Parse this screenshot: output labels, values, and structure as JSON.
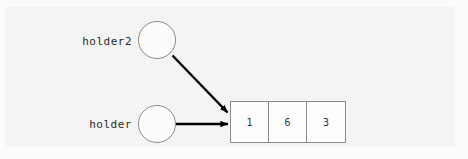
{
  "diagram": {
    "type": "pointer-to-array-diagram",
    "background_color": "#f4f4f4",
    "nodes": [
      {
        "id": "holder2",
        "label": "holder2",
        "shape": "circle",
        "fill": "#fcfcfc",
        "stroke": "#8a8a8a"
      },
      {
        "id": "holder",
        "label": "holder",
        "shape": "circle",
        "fill": "#fcfcfc",
        "stroke": "#8a8a8a"
      }
    ],
    "array": {
      "name": "array-box",
      "stroke": "#8a8a8a",
      "fill": "#fdfdfd",
      "cells": [
        {
          "value": "1"
        },
        {
          "value": "6"
        },
        {
          "value": "3"
        }
      ]
    },
    "arrows": [
      {
        "id": "holder2-arrow",
        "from": "holder2",
        "to": "array-box",
        "color": "#000000"
      },
      {
        "id": "holder-arrow",
        "from": "holder",
        "to": "array-box",
        "color": "#000000"
      }
    ]
  }
}
